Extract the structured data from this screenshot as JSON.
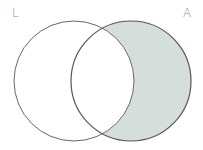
{
  "diagram": {
    "type": "venn",
    "sets": [
      {
        "label": "L",
        "shaded": false
      },
      {
        "label": "A",
        "shaded": true
      }
    ],
    "shaded_region": "A minus L",
    "colors": {
      "shade": "#d6dedb",
      "stroke": "#555555",
      "label": "#888888"
    }
  }
}
